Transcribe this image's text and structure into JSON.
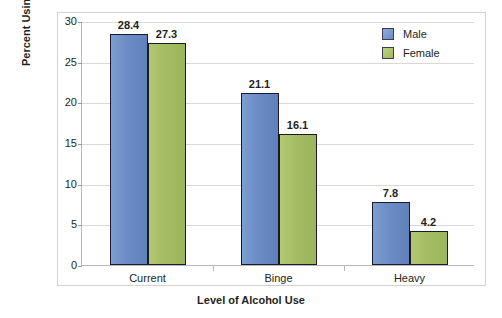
{
  "chart_data": {
    "type": "bar",
    "title": "",
    "xlabel": "Level of Alcohol Use",
    "ylabel": "Percent Using in Past Month",
    "categories": [
      "Current",
      "Binge",
      "Heavy"
    ],
    "series": [
      {
        "name": "Male",
        "color": "#6b8cc4",
        "values": [
          28.4,
          21.1,
          7.8
        ]
      },
      {
        "name": "Female",
        "color": "#a5bd62",
        "values": [
          27.3,
          16.1,
          4.2
        ]
      }
    ],
    "ylim": [
      0,
      30
    ],
    "yticks": [
      0,
      5,
      10,
      15,
      20,
      25,
      30
    ],
    "ytick_labels": [
      "0",
      "5",
      "10",
      "15",
      "20",
      "25",
      "30"
    ],
    "grid": true,
    "legend_position": "top-right",
    "value_labels": {
      "Current": {
        "Male": "28.4",
        "Female": "27.3"
      },
      "Binge": {
        "Male": "21.1",
        "Female": "16.1"
      },
      "Heavy": {
        "Male": "7.8",
        "Female": "4.2"
      }
    }
  },
  "legend": {
    "items": [
      {
        "label": "Male",
        "color": "#6b8cc4"
      },
      {
        "label": "Female",
        "color": "#a5bd62"
      }
    ]
  },
  "axes": {
    "y_title": "Percent Using in Past Month",
    "x_title": "Level of Alcohol Use"
  }
}
